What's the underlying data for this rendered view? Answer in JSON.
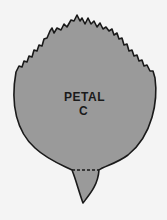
{
  "diagram": {
    "label_line1": "PETAL",
    "label_line2": "C",
    "colors": {
      "background": "#f4f4f4",
      "petal_fill": "#9a9a9a",
      "outline": "#1a1a1a"
    }
  }
}
